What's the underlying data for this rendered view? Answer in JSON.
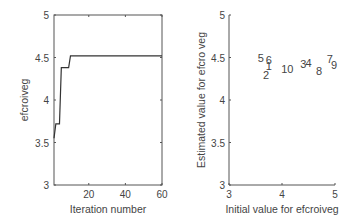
{
  "chart_data": [
    {
      "type": "line",
      "title": "",
      "xlabel": "Iteration number",
      "ylabel": "efcroiveg",
      "xlim": [
        1,
        60
      ],
      "ylim": [
        3,
        5
      ],
      "xticks": [
        "20",
        "40",
        "60"
      ],
      "yticks": [
        "3",
        "3.5",
        "4",
        "4.5",
        "5"
      ],
      "grid": false,
      "x": [
        1,
        2,
        3,
        4,
        5,
        6,
        7,
        8,
        9,
        10,
        20,
        30,
        40,
        50,
        60
      ],
      "series": [
        {
          "name": "efcroiveg",
          "values": [
            3.55,
            3.72,
            3.72,
            3.72,
            4.38,
            4.38,
            4.38,
            4.38,
            4.38,
            4.52,
            4.52,
            4.52,
            4.52,
            4.52,
            4.52
          ]
        }
      ]
    },
    {
      "type": "scatter",
      "title": "",
      "xlabel": "Initial value for efcroiveg",
      "ylabel": "Estimated value for efcro veg",
      "xlim": [
        3,
        5
      ],
      "ylim": [
        3,
        5
      ],
      "xticks": [
        "3",
        "4",
        "5"
      ],
      "yticks": [
        "3",
        "3.5",
        "4",
        "4.5",
        "5"
      ],
      "grid": false,
      "points": [
        {
          "label": "5",
          "x": 3.6,
          "y": 4.5
        },
        {
          "label": "6",
          "x": 3.75,
          "y": 4.47
        },
        {
          "label": "1",
          "x": 3.75,
          "y": 4.4
        },
        {
          "label": "2",
          "x": 3.7,
          "y": 4.3
        },
        {
          "label": "10",
          "x": 4.1,
          "y": 4.37
        },
        {
          "label": "3",
          "x": 4.4,
          "y": 4.42
        },
        {
          "label": "4",
          "x": 4.5,
          "y": 4.44
        },
        {
          "label": "8",
          "x": 4.7,
          "y": 4.34
        },
        {
          "label": "7",
          "x": 4.9,
          "y": 4.48
        },
        {
          "label": "9",
          "x": 4.98,
          "y": 4.41
        }
      ]
    }
  ]
}
